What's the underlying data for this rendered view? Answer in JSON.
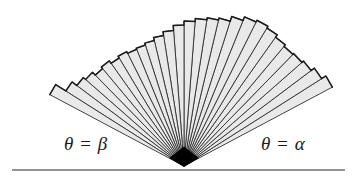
{
  "figure": {
    "background_color": "#ffffff",
    "width": 358,
    "height": 179
  },
  "baseline": {
    "name": "horizontal-axis-line",
    "color": "#6e6e6e",
    "y": 170,
    "x_start": 12,
    "x_end": 345,
    "thickness": 1.4
  },
  "apex": {
    "label": "vertex",
    "x": 184,
    "y": 166,
    "color": "#000000"
  },
  "labels": {
    "left": {
      "text": "θ = β",
      "theta": "θ",
      "equals": "=",
      "angle_symbol": "β",
      "x": 64,
      "y": 134
    },
    "right": {
      "text": "θ = α",
      "theta": "θ",
      "equals": "=",
      "angle_symbol": "α",
      "x": 261,
      "y": 134
    }
  },
  "chart_data": {
    "type": "pie",
    "subtitle": "",
    "xlabel": "",
    "ylabel": "",
    "origin": {
      "x": 184,
      "y": 166
    },
    "angle_units": "degrees",
    "angle_convention": "measured counter-clockwise from the positive x-axis (rightward along the baseline)",
    "theta_alpha_deg": 28,
    "theta_beta_deg": 152,
    "sector_count": 28,
    "fill_color": "#e9e9e9",
    "edge_color": "#303030",
    "outline_color": "#1c1c1c",
    "edge_width": 0.9,
    "legend_position": "none",
    "grid": false,
    "sectors": [
      {
        "index": 0,
        "theta_start_deg": 28.0,
        "theta_end_deg": 32.4,
        "radius": 168
      },
      {
        "index": 1,
        "theta_start_deg": 32.4,
        "theta_end_deg": 36.9,
        "radius": 163
      },
      {
        "index": 2,
        "theta_start_deg": 36.9,
        "theta_end_deg": 41.3,
        "radius": 159
      },
      {
        "index": 3,
        "theta_start_deg": 41.3,
        "theta_end_deg": 45.7,
        "radius": 157
      },
      {
        "index": 4,
        "theta_start_deg": 45.7,
        "theta_end_deg": 50.1,
        "radius": 156
      },
      {
        "index": 5,
        "theta_start_deg": 50.1,
        "theta_end_deg": 54.6,
        "radius": 158
      },
      {
        "index": 6,
        "theta_start_deg": 54.6,
        "theta_end_deg": 59.0,
        "radius": 161
      },
      {
        "index": 7,
        "theta_start_deg": 59.0,
        "theta_end_deg": 63.4,
        "radius": 163
      },
      {
        "index": 8,
        "theta_start_deg": 63.4,
        "theta_end_deg": 67.9,
        "radius": 161
      },
      {
        "index": 9,
        "theta_start_deg": 67.9,
        "theta_end_deg": 72.3,
        "radius": 157
      },
      {
        "index": 10,
        "theta_start_deg": 72.3,
        "theta_end_deg": 76.7,
        "radius": 152
      },
      {
        "index": 11,
        "theta_start_deg": 76.7,
        "theta_end_deg": 81.1,
        "radius": 150
      },
      {
        "index": 12,
        "theta_start_deg": 81.1,
        "theta_end_deg": 85.6,
        "radius": 148
      },
      {
        "index": 13,
        "theta_start_deg": 85.6,
        "theta_end_deg": 90.0,
        "radius": 145
      },
      {
        "index": 14,
        "theta_start_deg": 90.0,
        "theta_end_deg": 94.4,
        "radius": 141
      },
      {
        "index": 15,
        "theta_start_deg": 94.4,
        "theta_end_deg": 98.9,
        "radius": 136
      },
      {
        "index": 16,
        "theta_start_deg": 98.9,
        "theta_end_deg": 103.3,
        "radius": 132
      },
      {
        "index": 17,
        "theta_start_deg": 103.3,
        "theta_end_deg": 107.7,
        "radius": 129
      },
      {
        "index": 18,
        "theta_start_deg": 107.7,
        "theta_end_deg": 112.1,
        "radius": 127
      },
      {
        "index": 19,
        "theta_start_deg": 112.1,
        "theta_end_deg": 116.6,
        "radius": 126
      },
      {
        "index": 20,
        "theta_start_deg": 116.6,
        "theta_end_deg": 121.0,
        "radius": 128
      },
      {
        "index": 21,
        "theta_start_deg": 121.0,
        "theta_end_deg": 125.4,
        "radius": 126
      },
      {
        "index": 22,
        "theta_start_deg": 125.4,
        "theta_end_deg": 129.9,
        "radius": 129
      },
      {
        "index": 23,
        "theta_start_deg": 129.9,
        "theta_end_deg": 134.3,
        "radius": 127
      },
      {
        "index": 24,
        "theta_start_deg": 134.3,
        "theta_end_deg": 138.7,
        "radius": 131
      },
      {
        "index": 25,
        "theta_start_deg": 138.7,
        "theta_end_deg": 143.1,
        "radius": 134
      },
      {
        "index": 26,
        "theta_start_deg": 143.1,
        "theta_end_deg": 147.6,
        "radius": 140
      },
      {
        "index": 27,
        "theta_start_deg": 147.6,
        "theta_end_deg": 152.0,
        "radius": 152
      }
    ]
  }
}
